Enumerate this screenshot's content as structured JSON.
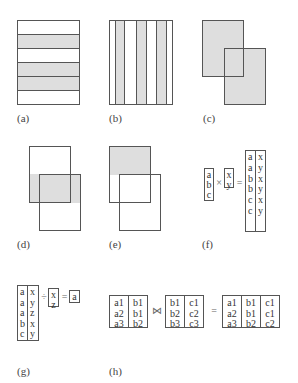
{
  "panels": {
    "a": {
      "label": "(a)",
      "description": "horizontal partition, rows 2, 4, 5 shaded"
    },
    "b": {
      "label": "(b)",
      "description": "vertical partition, alternating columns shaded"
    },
    "c": {
      "label": "(c)",
      "description": "union of two overlapping rectangles"
    },
    "d": {
      "label": "(d)",
      "description": "intersection band of two rectangles"
    },
    "e": {
      "label": "(e)",
      "description": "difference of two rectangles"
    },
    "f": {
      "label": "(f)",
      "left": [
        "a",
        "b",
        "c"
      ],
      "op1": "×",
      "right": [
        "x",
        "y"
      ],
      "op2": "=",
      "result": {
        "col1": [
          "a",
          "a",
          "b",
          "b",
          "c",
          "c"
        ],
        "col2": [
          "x",
          "y",
          "x",
          "y",
          "x",
          "y"
        ]
      }
    },
    "g": {
      "label": "(g)",
      "left": {
        "col1": [
          "a",
          "a",
          "a",
          "b",
          "c"
        ],
        "col2": [
          "x",
          "y",
          "z",
          "x",
          "y"
        ]
      },
      "op1": "÷",
      "right": [
        "x",
        "z"
      ],
      "op2": "=",
      "result": [
        "a"
      ]
    },
    "h": {
      "label": "(h)",
      "left": {
        "col1": [
          "a1",
          "a2",
          "a3"
        ],
        "col2": [
          "b1",
          "b1",
          "b2"
        ]
      },
      "op1": "⋈",
      "right": {
        "col1": [
          "b1",
          "b2",
          "b3"
        ],
        "col2": [
          "c1",
          "c2",
          "c3"
        ]
      },
      "op2": "=",
      "result": {
        "col1": [
          "a1",
          "a2",
          "a3"
        ],
        "col2": [
          "b1",
          "b1",
          "b2"
        ],
        "col3": [
          "c1",
          "c1",
          "c2"
        ]
      }
    }
  }
}
